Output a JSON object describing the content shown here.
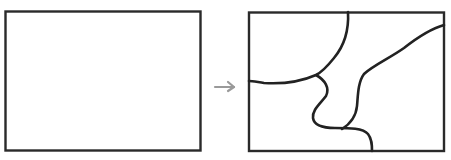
{
  "diagram": {
    "stroke_color": "#2a2a2a",
    "arrow_color": "#9a9a9a",
    "background": "#ffffff",
    "panels": [
      {
        "name": "before",
        "label": "",
        "regions": 1
      },
      {
        "name": "after",
        "label": "",
        "regions": 4
      }
    ],
    "arrow": {
      "direction": "right"
    }
  }
}
